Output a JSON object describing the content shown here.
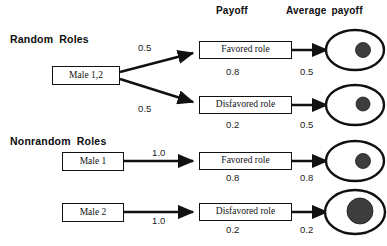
{
  "figure": {
    "column_headers": [
      {
        "label": "Payoff",
        "x": 216,
        "y": 5
      },
      {
        "label": "Average payoff",
        "x": 286,
        "y": 5
      }
    ],
    "sections": [
      {
        "name": "random-roles",
        "title": "Random Roles",
        "source_nodes": [
          {
            "label": "Male 1,2",
            "x": 52,
            "y": 66,
            "w": 68,
            "h": 19
          }
        ],
        "branches": [
          {
            "probability": "0.5",
            "role": "Favored role",
            "payoff": "0.8",
            "average_payoff": "0.5",
            "role_box": {
              "x": 199,
              "y": 41,
              "w": 93,
              "h": 18
            },
            "dot_radius": 7.5
          },
          {
            "probability": "0.5",
            "role": "Disfavored role",
            "payoff": "0.2",
            "average_payoff": "0.5",
            "role_box": {
              "x": 199,
              "y": 96,
              "w": 93,
              "h": 18
            },
            "dot_radius": 7.0
          }
        ]
      },
      {
        "name": "nonrandom-roles",
        "title": "Nonrandom Roles",
        "source_nodes": [
          {
            "label": "Male 1",
            "x": 62,
            "y": 152,
            "w": 62,
            "h": 19
          },
          {
            "label": "Male 2",
            "x": 62,
            "y": 203,
            "w": 62,
            "h": 19
          }
        ],
        "branches": [
          {
            "probability": "1.0",
            "role": "Favored role",
            "payoff": "0.8",
            "average_payoff": "0.8",
            "role_box": {
              "x": 199,
              "y": 152,
              "w": 93,
              "h": 18
            },
            "dot_radius": 7.5
          },
          {
            "probability": "1.0",
            "role": "Disfavored role",
            "payoff": "0.2",
            "average_payoff": "0.2",
            "role_box": {
              "x": 199,
              "y": 203,
              "w": 93,
              "h": 18
            },
            "dot_radius": 13.0
          }
        ]
      }
    ],
    "probability_labels": [
      {
        "value": "0.5",
        "x": 138,
        "y": 42
      },
      {
        "value": "0.5",
        "x": 138,
        "y": 103
      },
      {
        "value": "1.0",
        "x": 152,
        "y": 147
      },
      {
        "value": "1.0",
        "x": 152,
        "y": 215
      }
    ],
    "payoff_labels": [
      {
        "value": "0.8",
        "x": 226,
        "y": 66
      },
      {
        "value": "0.2",
        "x": 226,
        "y": 119
      },
      {
        "value": "0.8",
        "x": 226,
        "y": 172
      },
      {
        "value": "0.2",
        "x": 226,
        "y": 224
      }
    ],
    "average_payoff_labels": [
      {
        "value": "0.5",
        "x": 300,
        "y": 66
      },
      {
        "value": "0.5",
        "x": 300,
        "y": 119
      },
      {
        "value": "0.8",
        "x": 300,
        "y": 172
      },
      {
        "value": "0.2",
        "x": 300,
        "y": 224
      }
    ],
    "colors": {
      "line": "#111111",
      "dot_fill": "#3d3d3d",
      "background": "#ffffff"
    }
  }
}
